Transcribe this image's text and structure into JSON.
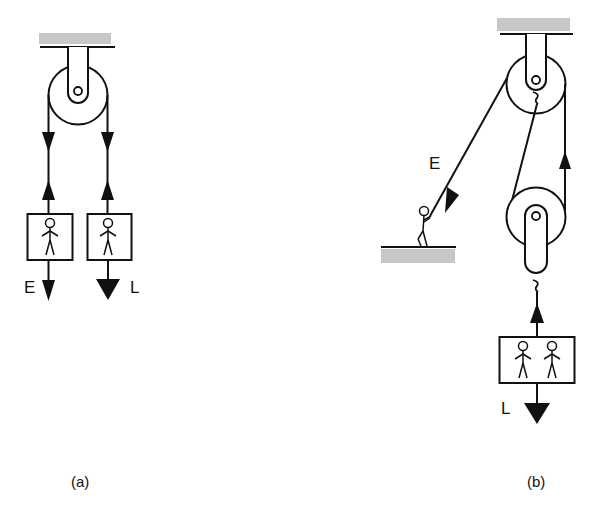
{
  "colors": {
    "ink": "#111111",
    "ceiling_fill": "#c8c8c8",
    "background": "#ffffff"
  },
  "diagram": {
    "type": "pulley-systems",
    "panels": [
      {
        "id": "a",
        "caption": "(a)",
        "description": "Single fixed pulley with two boxes hanging from each rope end",
        "elements": {
          "ceiling": true,
          "pulleys": 1,
          "boxes": [
            {
              "label": "E",
              "people": 1,
              "arrow": "down",
              "arrow_size": "small"
            },
            {
              "label": "L",
              "people": 1,
              "arrow": "down",
              "arrow_size": "large"
            }
          ],
          "rope_arrows": [
            "down",
            "up",
            "down",
            "up"
          ]
        }
      },
      {
        "id": "b",
        "caption": "(b)",
        "description": "Fixed pulley plus movable pulley; a person on the ground pulls the effort rope",
        "elements": {
          "ceiling": true,
          "ground": true,
          "pulleys": 2,
          "effort_label": "E",
          "load_label": "L",
          "boxes": [
            {
              "label": "L",
              "people": 2,
              "arrow": "down",
              "arrow_size": "large"
            }
          ]
        }
      }
    ]
  }
}
